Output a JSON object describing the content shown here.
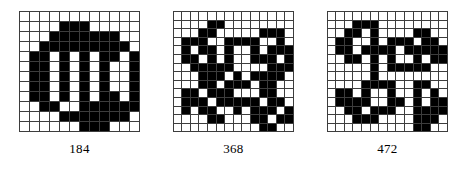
{
  "figure": {
    "name": "bitmap-pattern-figure",
    "background_color": "#ffffff",
    "ink_color": "#000000",
    "grid_line_color": "#3d3d3d"
  },
  "panels": [
    {
      "id": "panel-184",
      "caption": "184",
      "rows": 12,
      "cols": 12,
      "cell_size": 10,
      "bits": [
        [
          0,
          0,
          0,
          0,
          0,
          0,
          0,
          0,
          0,
          0,
          0,
          0
        ],
        [
          0,
          0,
          0,
          0,
          1,
          1,
          1,
          0,
          0,
          0,
          0,
          0
        ],
        [
          0,
          0,
          0,
          1,
          1,
          1,
          1,
          1,
          1,
          1,
          0,
          0
        ],
        [
          0,
          0,
          1,
          1,
          1,
          1,
          1,
          1,
          1,
          1,
          1,
          0
        ],
        [
          0,
          1,
          1,
          0,
          1,
          0,
          1,
          0,
          1,
          1,
          0,
          1
        ],
        [
          0,
          1,
          1,
          0,
          1,
          0,
          1,
          0,
          1,
          0,
          0,
          1
        ],
        [
          0,
          1,
          1,
          0,
          1,
          0,
          1,
          0,
          1,
          0,
          0,
          1
        ],
        [
          0,
          1,
          1,
          0,
          1,
          0,
          1,
          0,
          1,
          0,
          0,
          1
        ],
        [
          0,
          1,
          1,
          0,
          1,
          0,
          1,
          0,
          1,
          1,
          0,
          1
        ],
        [
          0,
          0,
          1,
          1,
          0,
          0,
          1,
          1,
          1,
          1,
          1,
          1
        ],
        [
          0,
          0,
          0,
          0,
          1,
          1,
          1,
          1,
          1,
          1,
          1,
          0
        ],
        [
          0,
          0,
          0,
          0,
          0,
          0,
          1,
          1,
          1,
          0,
          0,
          0
        ]
      ]
    },
    {
      "id": "panel-368",
      "caption": "368",
      "rows": 14,
      "cols": 14,
      "cell_size": 8.6,
      "bits": [
        [
          0,
          0,
          0,
          0,
          0,
          0,
          0,
          0,
          0,
          0,
          0,
          0,
          0,
          0
        ],
        [
          0,
          0,
          0,
          0,
          1,
          1,
          0,
          0,
          0,
          0,
          0,
          0,
          0,
          0
        ],
        [
          0,
          0,
          0,
          1,
          1,
          0,
          0,
          0,
          0,
          0,
          1,
          1,
          1,
          0
        ],
        [
          0,
          1,
          1,
          1,
          0,
          0,
          1,
          1,
          1,
          1,
          0,
          0,
          1,
          0
        ],
        [
          0,
          1,
          0,
          1,
          1,
          0,
          1,
          0,
          0,
          1,
          0,
          1,
          1,
          1
        ],
        [
          0,
          1,
          1,
          0,
          1,
          0,
          1,
          0,
          0,
          1,
          1,
          1,
          0,
          1
        ],
        [
          0,
          0,
          1,
          1,
          1,
          1,
          1,
          0,
          0,
          0,
          0,
          1,
          1,
          1
        ],
        [
          0,
          0,
          0,
          1,
          1,
          1,
          0,
          1,
          0,
          1,
          1,
          1,
          1,
          0
        ],
        [
          0,
          0,
          0,
          1,
          1,
          0,
          1,
          1,
          1,
          0,
          1,
          1,
          0,
          0
        ],
        [
          0,
          1,
          1,
          0,
          1,
          1,
          1,
          0,
          0,
          0,
          1,
          1,
          0,
          0
        ],
        [
          0,
          1,
          1,
          1,
          0,
          1,
          1,
          1,
          1,
          1,
          0,
          1,
          1,
          0
        ],
        [
          0,
          1,
          0,
          1,
          1,
          0,
          0,
          1,
          0,
          1,
          1,
          1,
          0,
          1
        ],
        [
          0,
          0,
          0,
          0,
          1,
          1,
          0,
          0,
          0,
          1,
          1,
          0,
          1,
          1
        ],
        [
          0,
          0,
          0,
          0,
          0,
          0,
          0,
          0,
          0,
          0,
          1,
          1,
          0,
          0
        ]
      ]
    },
    {
      "id": "panel-472",
      "caption": "472",
      "rows": 14,
      "cols": 14,
      "cell_size": 8.6,
      "bits": [
        [
          0,
          0,
          0,
          0,
          0,
          0,
          0,
          0,
          0,
          0,
          0,
          0,
          0,
          0
        ],
        [
          0,
          0,
          0,
          1,
          1,
          1,
          0,
          0,
          0,
          0,
          0,
          0,
          0,
          0
        ],
        [
          0,
          0,
          1,
          1,
          0,
          1,
          0,
          0,
          0,
          0,
          1,
          1,
          0,
          0
        ],
        [
          0,
          1,
          1,
          0,
          0,
          1,
          0,
          1,
          1,
          1,
          0,
          1,
          1,
          0
        ],
        [
          0,
          1,
          1,
          0,
          1,
          1,
          1,
          1,
          0,
          1,
          1,
          1,
          1,
          1
        ],
        [
          0,
          0,
          1,
          1,
          0,
          1,
          0,
          1,
          0,
          0,
          1,
          0,
          1,
          1
        ],
        [
          0,
          0,
          0,
          0,
          0,
          1,
          0,
          1,
          1,
          1,
          1,
          1,
          0,
          0
        ],
        [
          0,
          0,
          0,
          0,
          0,
          1,
          0,
          0,
          0,
          0,
          0,
          0,
          0,
          0
        ],
        [
          0,
          0,
          0,
          0,
          1,
          1,
          1,
          1,
          0,
          0,
          1,
          1,
          0,
          0
        ],
        [
          0,
          1,
          1,
          0,
          1,
          0,
          0,
          1,
          0,
          0,
          1,
          0,
          1,
          0
        ],
        [
          0,
          1,
          1,
          1,
          1,
          0,
          0,
          1,
          1,
          0,
          1,
          0,
          1,
          1
        ],
        [
          0,
          0,
          1,
          1,
          0,
          1,
          1,
          1,
          0,
          0,
          1,
          1,
          1,
          1
        ],
        [
          0,
          0,
          0,
          1,
          1,
          1,
          0,
          0,
          0,
          0,
          1,
          1,
          1,
          0
        ],
        [
          0,
          0,
          0,
          0,
          0,
          0,
          0,
          0,
          0,
          0,
          1,
          1,
          0,
          0
        ]
      ]
    }
  ]
}
